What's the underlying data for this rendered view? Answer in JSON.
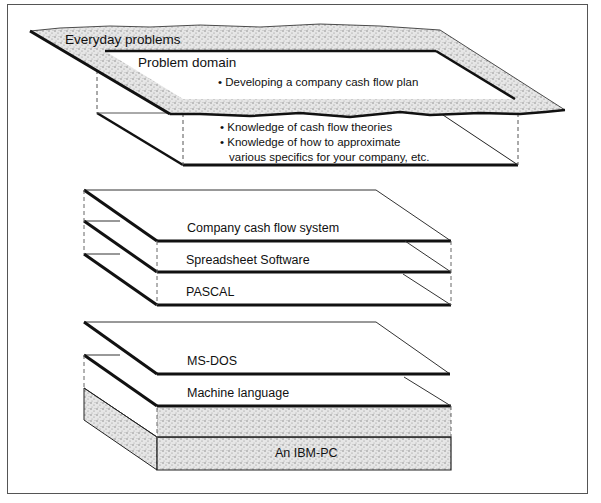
{
  "diagram": {
    "type": "layered-abstraction",
    "groups": [
      {
        "name": "problem",
        "layers": [
          {
            "label": "Everyday problems",
            "style": "stippled-torn"
          },
          {
            "label": "Problem domain",
            "bullets": [
              "• Developing a company cash flow plan"
            ]
          },
          {
            "label": "",
            "bullets": [
              "• Knowledge of cash flow theories",
              "• Knowledge of how to approximate",
              "various specifics for your company, etc."
            ]
          }
        ]
      },
      {
        "name": "software",
        "layers": [
          {
            "label": "Company cash flow system"
          },
          {
            "label": "Spreadsheet  Software"
          },
          {
            "label": "PASCAL"
          }
        ]
      },
      {
        "name": "system",
        "layers": [
          {
            "label": "MS-DOS"
          },
          {
            "label": "Machine language"
          },
          {
            "label": "An IBM-PC",
            "style": "stippled-block"
          }
        ]
      }
    ]
  }
}
